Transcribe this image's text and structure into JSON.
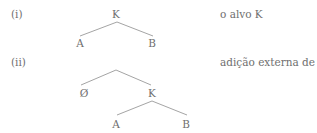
{
  "examples": [
    {
      "label": "(i)",
      "caption": "o alvo K",
      "tree": {
        "root": "K",
        "children": [
          "A",
          "B"
        ]
      }
    },
    {
      "label": "(ii)",
      "caption": "adição externa de Ø",
      "tree": {
        "root": "",
        "children": [
          "Ø",
          "K"
        ],
        "subtree": {
          "root": "K",
          "children": [
            "A",
            "B"
          ]
        }
      }
    }
  ],
  "colors": {
    "text": "#6f6f6f",
    "edges": "#9a9a9a",
    "background": "#ffffff"
  }
}
